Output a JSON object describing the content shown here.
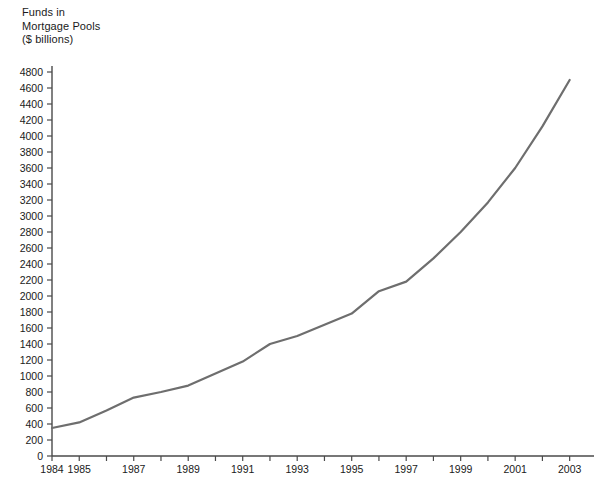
{
  "chart_data": {
    "type": "line",
    "title": "Funds in\nMortgage Pools\n($ billions)",
    "title_lines": [
      "Funds in",
      "Mortgage Pools",
      "($ billions)"
    ],
    "xlabel": "",
    "ylabel": "Funds in Mortgage Pools ($ billions)",
    "xlim": [
      1984,
      2003.6
    ],
    "ylim": [
      0,
      4800
    ],
    "grid": false,
    "legend": "none",
    "y_tick_step": 200,
    "y_ticks": [
      0,
      200,
      400,
      600,
      800,
      1000,
      1200,
      1400,
      1600,
      1800,
      2000,
      2200,
      2400,
      2600,
      2800,
      3000,
      3200,
      3400,
      3600,
      3800,
      4000,
      4200,
      4400,
      4600,
      4800
    ],
    "x_ticks": [
      1984,
      1985,
      1986,
      1987,
      1988,
      1989,
      1990,
      1991,
      1992,
      1993,
      1994,
      1995,
      1996,
      1997,
      1998,
      1999,
      2000,
      2001,
      2002,
      2003
    ],
    "x_tick_labels": [
      "1984",
      "1985",
      "",
      "1987",
      "",
      "1989",
      "",
      "1991",
      "",
      "1993",
      "",
      "1995",
      "",
      "1997",
      "",
      "1999",
      "",
      "2001",
      "",
      "2003"
    ],
    "series": [
      {
        "name": "Funds in Mortgage Pools",
        "color": "#6e6e6e",
        "x": [
          1984,
          1985,
          1986,
          1987,
          1988,
          1989,
          1990,
          1991,
          1992,
          1993,
          1994,
          1995,
          1996,
          1997,
          1998,
          1999,
          2000,
          2001,
          2002,
          2003
        ],
        "values": [
          350,
          420,
          570,
          730,
          800,
          880,
          1030,
          1180,
          1400,
          1500,
          1640,
          1780,
          2060,
          2180,
          2470,
          2800,
          3170,
          3600,
          4120,
          4700
        ]
      }
    ]
  },
  "axes": {
    "line_color": "#4a4a4a",
    "tick_color": "#4a4a4a"
  }
}
